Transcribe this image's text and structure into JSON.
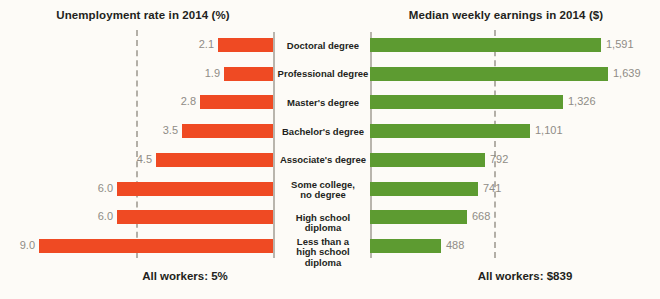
{
  "figure": {
    "background_color": "#fdfbf7",
    "bar_color_left": "#ef4a23",
    "bar_color_right": "#5d9b31",
    "value_text_color": "#8f8c86",
    "axis_color": "#b9b5ad",
    "dash_color": "#b3afa7"
  },
  "left_panel": {
    "title": "Unemployment rate in 2014 (%)",
    "footnote": "All workers: 5%"
  },
  "right_panel": {
    "title": "Median weekly earnings in 2014 ($)",
    "footnote": "All workers: $839"
  },
  "chart_data": {
    "type": "bar",
    "orientation": "horizontal-diverging",
    "categories": [
      "Doctoral degree",
      "Professional degree",
      "Master's degree",
      "Bachelor's degree",
      "Associate's degree",
      "Some college,\nno degree",
      "High school diploma",
      "Less than a\nhigh school diploma"
    ],
    "series": [
      {
        "name": "Unemployment rate in 2014 (%)",
        "side": "left",
        "color": "#ef4a23",
        "unit": "%",
        "values": [
          2.1,
          1.9,
          2.8,
          3.5,
          4.5,
          6.0,
          6.0,
          9.0
        ],
        "labels": [
          "2.1",
          "1.9",
          "2.8",
          "3.5",
          "4.5",
          "6.0",
          "6.0",
          "9.0"
        ],
        "reference_line": {
          "value": 5,
          "label": "All workers: 5%"
        },
        "axis_max": 10.4,
        "xlabel": "Unemployment rate in 2014 (%)"
      },
      {
        "name": "Median weekly earnings in 2014 ($)",
        "side": "right",
        "color": "#5d9b31",
        "unit": "$",
        "values": [
          1591,
          1639,
          1326,
          1101,
          792,
          741,
          668,
          488
        ],
        "labels": [
          "1,591",
          "1,639",
          "1,326",
          "1,101",
          "792",
          "741",
          "668",
          "488"
        ],
        "reference_line": {
          "value": 839,
          "label": "All workers: $839"
        },
        "axis_max": 1980,
        "xlabel": "Median weekly earnings in 2014 ($)"
      }
    ],
    "grid": false,
    "legend": "none"
  }
}
